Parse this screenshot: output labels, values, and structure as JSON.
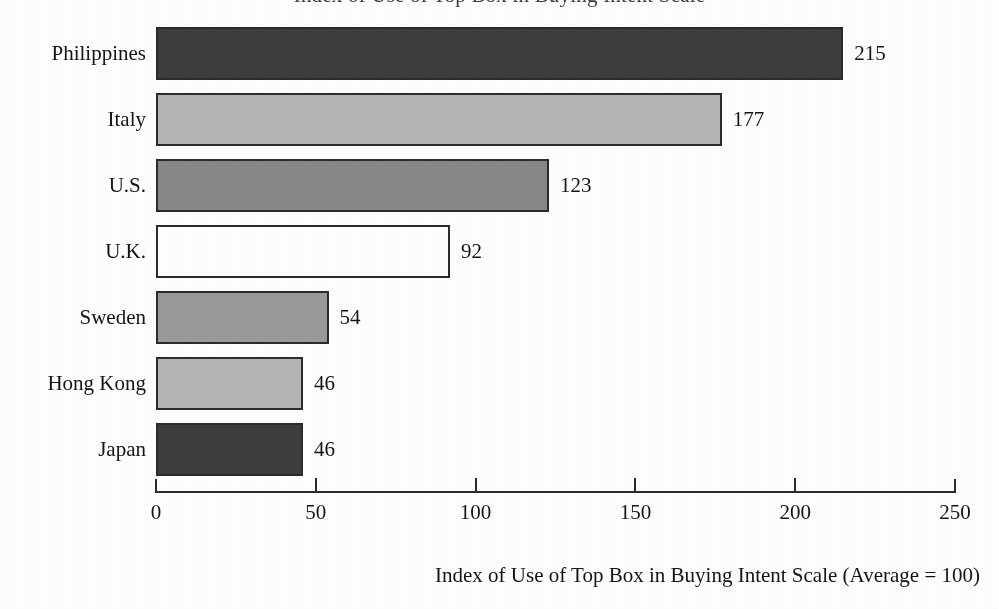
{
  "chart_data": {
    "type": "bar",
    "orientation": "horizontal",
    "title": "Index of Use of Top Box in Buying Intent Scale",
    "title_clipped": true,
    "xlabel": "Index of Use of Top Box in Buying Intent Scale (Average = 100)",
    "ylabel": "",
    "categories": [
      "Philippines",
      "Italy",
      "U.S.",
      "U.K.",
      "Sweden",
      "Hong Kong",
      "Japan"
    ],
    "values": [
      215,
      177,
      123,
      92,
      54,
      46,
      46
    ],
    "value_labels": [
      "215",
      "177",
      "123",
      "92",
      "54",
      "46",
      "46"
    ],
    "bar_colors": [
      "#3d3d3d",
      "#b5b5b5",
      "#888888",
      "#ffffff",
      "#9a9a9a",
      "#b5b5b5",
      "#3d3d3d"
    ],
    "bar_border_color": "#2b2b2b",
    "xlim": [
      0,
      250
    ],
    "xticks": [
      0,
      50,
      100,
      150,
      200,
      250
    ],
    "xtick_labels": [
      "0",
      "50",
      "100",
      "150",
      "200",
      "250"
    ],
    "grid": false,
    "legend": null,
    "average_reference": 100
  },
  "axis": {
    "title": "Index of Use of Top Box in Buying Intent Scale (Average = 100)"
  }
}
